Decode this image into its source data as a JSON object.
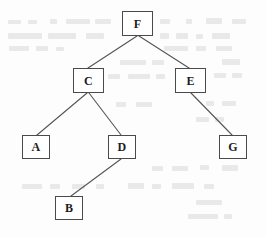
{
  "diagram": {
    "type": "tree",
    "canvas": {
      "width": 266,
      "height": 237
    },
    "background_color": "#fdfdfd",
    "node_fill_color": "#ffffff",
    "node_border_color": "#4a4a4a",
    "edge_color": "#555555",
    "label_color": "#1c1c1c",
    "root": "F",
    "nodes": [
      {
        "id": "F",
        "label": "F",
        "x": 122,
        "y": 11,
        "w": 31,
        "h": 25
      },
      {
        "id": "C",
        "label": "C",
        "x": 73,
        "y": 68,
        "w": 31,
        "h": 25
      },
      {
        "id": "E",
        "label": "E",
        "x": 175,
        "y": 68,
        "w": 31,
        "h": 25
      },
      {
        "id": "A",
        "label": "A",
        "x": 22,
        "y": 135,
        "w": 28,
        "h": 24
      },
      {
        "id": "D",
        "label": "D",
        "x": 108,
        "y": 135,
        "w": 28,
        "h": 24
      },
      {
        "id": "G",
        "label": "G",
        "x": 219,
        "y": 135,
        "w": 28,
        "h": 24
      },
      {
        "id": "B",
        "label": "B",
        "x": 55,
        "y": 196,
        "w": 28,
        "h": 24
      }
    ],
    "edges": [
      {
        "from": "F",
        "to": "C",
        "x1": 137,
        "y1": 36,
        "x2": 88,
        "y2": 68
      },
      {
        "from": "F",
        "to": "E",
        "x1": 139,
        "y1": 36,
        "x2": 189,
        "y2": 68
      },
      {
        "from": "C",
        "to": "A",
        "x1": 87,
        "y1": 93,
        "x2": 37,
        "y2": 135
      },
      {
        "from": "C",
        "to": "D",
        "x1": 89,
        "y1": 93,
        "x2": 121,
        "y2": 135
      },
      {
        "from": "E",
        "to": "G",
        "x1": 191,
        "y1": 93,
        "x2": 232,
        "y2": 135
      },
      {
        "from": "D",
        "to": "B",
        "x1": 121,
        "y1": 159,
        "x2": 71,
        "y2": 196
      }
    ]
  }
}
